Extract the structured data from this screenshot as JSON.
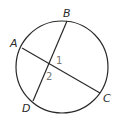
{
  "diagram": {
    "type": "circle-intersecting-chords",
    "circle": {
      "cx": 62,
      "cy": 67,
      "r": 46
    },
    "points": {
      "A": {
        "label": "A",
        "x": 22,
        "y": 48
      },
      "B": {
        "label": "B",
        "x": 67,
        "y": 21
      },
      "C": {
        "label": "C",
        "x": 100,
        "y": 93
      },
      "D": {
        "label": "D",
        "x": 33,
        "y": 101
      }
    },
    "chords": [
      {
        "from": "A",
        "to": "C"
      },
      {
        "from": "B",
        "to": "D"
      }
    ],
    "angle_labels": [
      {
        "label": "1",
        "x": 57,
        "y": 63
      },
      {
        "label": "2",
        "x": 47,
        "y": 80
      }
    ],
    "colors": {
      "stroke": "#2a2a2a",
      "angle_label": "#777777"
    }
  }
}
